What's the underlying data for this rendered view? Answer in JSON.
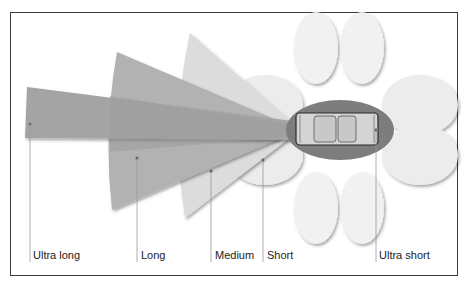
{
  "diagram": {
    "zones": [
      {
        "id": "ultra-long",
        "label": "Ultra long",
        "color": "#a8a8a8"
      },
      {
        "id": "long",
        "label": "Long",
        "color": "#b4b4b4"
      },
      {
        "id": "medium",
        "label": "Medium",
        "color": "#dedede"
      },
      {
        "id": "short",
        "label": "Short",
        "color": "#ebebeb"
      },
      {
        "id": "ultra-short",
        "label": "Ultra short",
        "color": "#7c7c7c"
      }
    ],
    "labels": {
      "ultra_long": "Ultra long",
      "long": "Long",
      "medium": "Medium",
      "short": "Short",
      "ultra_short": "Ultra short"
    },
    "colors": {
      "frame": "#3a3a3a",
      "car_body": "#d6d6d6",
      "car_outline": "#2a2a2a",
      "leader_line": "#9a9a9a",
      "lobes": "#f2f2f2"
    }
  }
}
